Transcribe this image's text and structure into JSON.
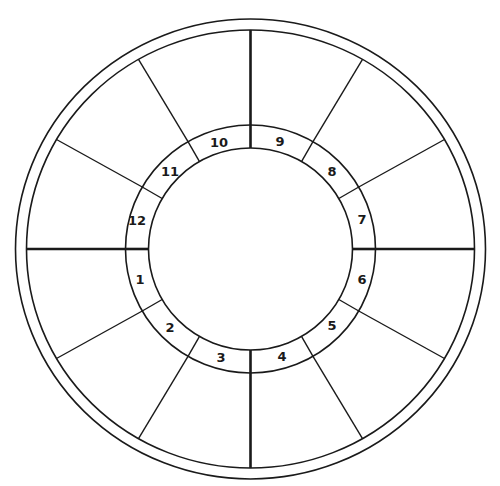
{
  "chart_data": {
    "type": "diagram",
    "title": "",
    "center": [
      250.5,
      249
    ],
    "circles": [
      {
        "name": "outer-border",
        "rx": 235,
        "ry": 230
      },
      {
        "name": "zodiac-ring",
        "rx": 224,
        "ry": 219
      },
      {
        "name": "house-ring-outer",
        "rx": 125,
        "ry": 124
      },
      {
        "name": "house-ring-inner",
        "rx": 102,
        "ry": 101
      }
    ],
    "spokes": {
      "count": 12,
      "step_deg": 30,
      "thick_angles_deg": [
        0,
        90,
        180,
        270
      ]
    },
    "houses": [
      {
        "number": "1",
        "x": 140,
        "y": 280
      },
      {
        "number": "2",
        "x": 170,
        "y": 328
      },
      {
        "number": "3",
        "x": 221,
        "y": 358
      },
      {
        "number": "4",
        "x": 282,
        "y": 357
      },
      {
        "number": "5",
        "x": 332,
        "y": 326
      },
      {
        "number": "6",
        "x": 362,
        "y": 280
      },
      {
        "number": "7",
        "x": 362,
        "y": 220
      },
      {
        "number": "8",
        "x": 332,
        "y": 172
      },
      {
        "number": "9",
        "x": 280,
        "y": 142
      },
      {
        "number": "10",
        "x": 219,
        "y": 143
      },
      {
        "number": "11",
        "x": 170,
        "y": 172
      },
      {
        "number": "12",
        "x": 137,
        "y": 221
      }
    ],
    "colors": {
      "stroke": "#1a1a1a",
      "background": "#ffffff"
    }
  }
}
